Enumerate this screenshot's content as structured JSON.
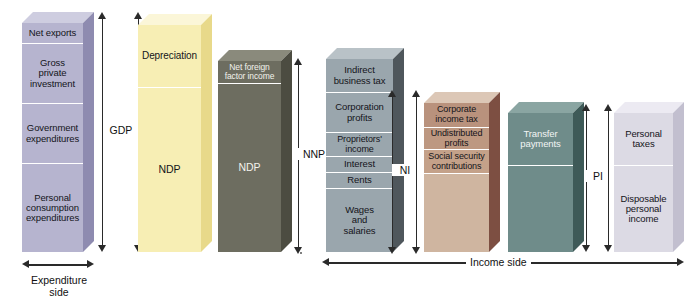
{
  "figure": {
    "type": "diagram"
  },
  "colors": {
    "lavender": "#b6b4cf",
    "lavender_top": "#cecde0",
    "lavender_side": "#8e8bb0",
    "yellow": "#f7eeb4",
    "yellow_top": "#fbf6d8",
    "yellow_side": "#e8d98a",
    "olive": "#6d6d60",
    "olive_top": "#8a8a7c",
    "olive_side": "#4c4c41",
    "slate": "#9aa6ad",
    "slate_top": "#b9c2c7",
    "slate_side": "#4f575c",
    "tan": "#cfb5a0",
    "tan_top": "#dcc7b6",
    "tan_side": "#7d4f42",
    "teal": "#6f8c8a",
    "teal_top": "#8aa5a2",
    "teal_side": "#3e5a58",
    "pale": "#dcdae4",
    "pale_top": "#eceaf2",
    "pale_side": "#c2bfcf",
    "arrow": "#2a2a2a",
    "seam": "#ffffff"
  },
  "columns": [
    {
      "id": "expenditure-gdp",
      "name": "gdp-expenditure-column",
      "palette": "lavender",
      "segments": [
        {
          "label": "Net exports"
        },
        {
          "label": "Gross\nprivate\ninvestment"
        },
        {
          "label": "Government\nexpenditures"
        },
        {
          "label": "Personal\nconsumption\nexpenditures"
        }
      ]
    },
    {
      "id": "gdp-ndp",
      "name": "ndp-depreciation-column",
      "palette": "yellow",
      "segments": [
        {
          "label": "Depreciation"
        },
        {
          "label": "NDP"
        }
      ]
    },
    {
      "id": "ndp-nnp",
      "name": "nnp-column",
      "palette": "olive",
      "segments": [
        {
          "label": "Net foreign\nfactor income"
        },
        {
          "label": "NDP"
        }
      ]
    },
    {
      "id": "national-income",
      "name": "national-income-column",
      "palette": "slate",
      "segments": [
        {
          "label": "Indirect\nbusiness tax"
        },
        {
          "label": "Corporation\nprofits"
        },
        {
          "label": "Proprietors'\nincome"
        },
        {
          "label": "Interest"
        },
        {
          "label": "Rents"
        },
        {
          "label": "Wages\nand\nsalaries"
        }
      ]
    },
    {
      "id": "ni-deductions",
      "name": "ni-deductions-column",
      "palette": "tan",
      "segments": [
        {
          "label": "Corporate\nincome tax"
        },
        {
          "label": "Undistributed\nprofits"
        },
        {
          "label": "Social security\ncontributions"
        },
        {
          "label": ""
        }
      ]
    },
    {
      "id": "transfer-payments",
      "name": "transfer-payments-column",
      "palette": "teal",
      "segments": [
        {
          "label": "Transfer\npayments"
        },
        {
          "label": ""
        }
      ]
    },
    {
      "id": "personal-income",
      "name": "personal-income-column",
      "palette": "pale",
      "segments": [
        {
          "label": "Personal\ntaxes"
        },
        {
          "label": "Disposable\npersonal\nincome"
        }
      ]
    }
  ],
  "brackets": {
    "gdp": "GDP",
    "nnp": "NNP",
    "ni": "NI",
    "pi": "PI"
  },
  "axis_labels": {
    "expenditure_side": "Expenditure\nside",
    "income_side": "Income side"
  }
}
